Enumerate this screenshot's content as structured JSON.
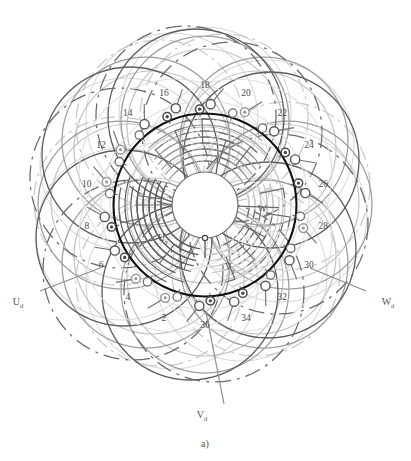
{
  "figure": {
    "caption": "a)",
    "center": {
      "x": 205,
      "y": 205
    },
    "bore_radius": 92,
    "hub_radius": 33,
    "colors": {
      "bore_outline": "#111111",
      "dark_arc": "#555555",
      "mid_arc": "#8a8a8a",
      "light_arc": "#bcbcbc",
      "pale_arc": "#d6d6d6",
      "label": "#4b4b4b",
      "background": "#ffffff"
    }
  },
  "slots": {
    "count": 18,
    "start_angle_deg": 200,
    "step_deg": 20,
    "label_radius": 120,
    "node_radius_outer": 101,
    "node_radius_inner": 96,
    "numbers": [
      2,
      4,
      6,
      8,
      10,
      12,
      14,
      16,
      18,
      20,
      22,
      24,
      26,
      28,
      30,
      32,
      34,
      36
    ],
    "marker_types": [
      "ring",
      "ring",
      "donut",
      "donut",
      "ring",
      "ring",
      "circle",
      "donut",
      "donut",
      "ring",
      "circle",
      "donut",
      "donut",
      "ring",
      "circle",
      "circle",
      "donut",
      "donut"
    ]
  },
  "terminals": {
    "delta": [
      {
        "name": "U_d",
        "base": "U",
        "sub": "d",
        "x": 18,
        "y": 305,
        "lead_x": 100,
        "lead_y": 268
      },
      {
        "name": "V_d",
        "base": "V",
        "sub": "d",
        "x": 202,
        "y": 418,
        "lead_x": 206,
        "lead_y": 312
      },
      {
        "name": "W_d",
        "base": "W",
        "sub": "d",
        "x": 388,
        "y": 305,
        "lead_x": 310,
        "lead_y": 268
      }
    ],
    "wye": [
      {
        "name": "U_y",
        "base": "U",
        "sub": "y",
        "x": 163,
        "y": 241
      },
      {
        "name": "V_y",
        "base": "V",
        "sub": "y",
        "x": 230,
        "y": 270
      },
      {
        "name": "W_y",
        "base": "W",
        "sub": "y",
        "x": 264,
        "y": 212
      }
    ]
  },
  "petals": {
    "count": 9,
    "ring_radius": 78,
    "petal_radius": 86,
    "styles": [
      "solid-dark",
      "solid-mid",
      "dashdot-mid",
      "solid-light",
      "dashed-dark",
      "solid-pale",
      "dashdot-light",
      "solid-mid",
      "solid-light"
    ]
  },
  "inner_bands": {
    "radii": [
      44,
      50,
      56,
      62,
      68,
      74,
      80,
      86
    ],
    "phase_groups": 3
  }
}
